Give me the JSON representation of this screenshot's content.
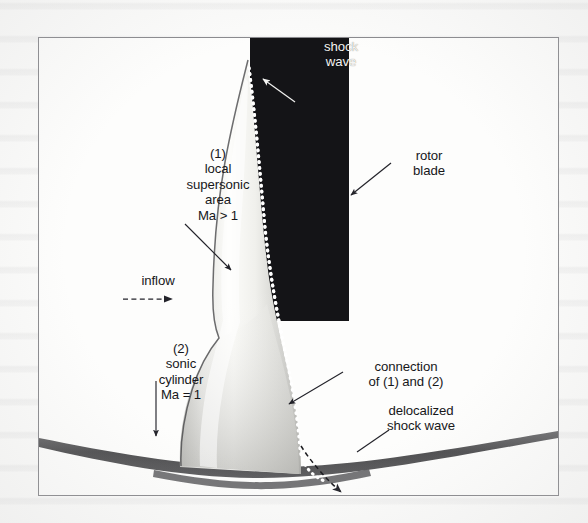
{
  "figure": {
    "type": "technical-diagram",
    "frame": {
      "x": 38,
      "y": 37,
      "width": 519,
      "height": 457
    }
  },
  "colors": {
    "paper": "#fbfbfa",
    "frame_line": "#8a8a8e",
    "blade_black": "#121214",
    "plume_bright": "#fdfdfb",
    "plume_mid": "#b9b9b5",
    "sonic_band": "#5a5a5c",
    "text_dark": "#17171a",
    "text_white": "#f4f4f2",
    "shock_dots": "#ffffff",
    "leader_line": "#23232a"
  },
  "labels": {
    "shock_wave": {
      "text": "shock\nwave",
      "color": "white",
      "x": 299,
      "y": 38
    },
    "rotor_blade": {
      "text": "rotor\nblade",
      "color": "dark",
      "x": 388,
      "y": 147
    },
    "local_supersonic": {
      "text": "(1)\nlocal\nsupersonic\narea\nMa > 1",
      "color": "dark",
      "x": 157,
      "y": 145
    },
    "inflow": {
      "text": "inflow",
      "color": "dark",
      "x": 120,
      "y": 272
    },
    "sonic_cylinder": {
      "text": "(2)\nsonic\ncylinder\nMa = 1",
      "color": "dark",
      "x": 128,
      "y": 340
    },
    "connection": {
      "text": "connection\nof (1) and (2)",
      "color": "dark",
      "x": 346,
      "y": 358
    },
    "delocalized_shock": {
      "text": "delocalized\nshock wave",
      "color": "dark",
      "x": 364,
      "y": 402
    }
  },
  "annotations": {
    "shock_wave_arrow": "white arrowhead pointing up-left at the dotted shock line near blade tip",
    "rotor_blade_arrow": "arrow pointing down-left to black blade right edge",
    "supersonic_arrow": "arrow pointing down-right into bright plume",
    "inflow_arrow": "dashed horizontal arrow pointing right",
    "sonic_cylinder_arrow": "vertical leader pointing down to dark band",
    "connection_arrow": "arrow pointing down-left to dotted shock line",
    "delocalized_arrow": "dashed arrow pointing down-right to band intersection"
  },
  "elements": {
    "rotor_blade_rect": {
      "x": 249,
      "y": 37,
      "width": 99,
      "height": 283
    },
    "supersonic_plume": "vertical bright lobe, pointed at top, flaring wide at bottom",
    "shock_line": "white dotted curve along plume right edge",
    "sonic_cylinder_band": "dark gray sagging band crossing figure near bottom"
  }
}
